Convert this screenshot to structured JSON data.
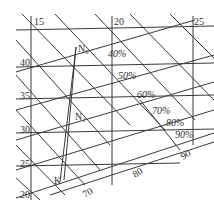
{
  "diagram": {
    "type": "psychrometric-chart-fragment",
    "vertical_line_labels": [
      "15",
      "20",
      "25"
    ],
    "horizontal_line_labels": [
      "40",
      "35",
      "30",
      "25",
      "20"
    ],
    "rh_labels": [
      "40%",
      "50%",
      "60%",
      "70%",
      "80%",
      "90%"
    ],
    "bottom_labels": [
      "70",
      "80",
      "90"
    ],
    "points": {
      "n0": "N₀",
      "n1": "N₁",
      "k": "K"
    },
    "colors": {
      "line": "#3a3a3a",
      "text": "#333333",
      "background": "#ffffff"
    }
  }
}
